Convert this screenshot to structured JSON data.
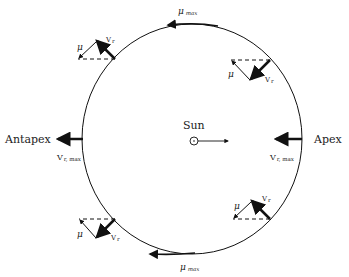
{
  "diagram": {
    "center_label": "Sun",
    "left_label": "Antapex",
    "right_label": "Apex",
    "top_label": {
      "symbol": "μ",
      "subscript": "max"
    },
    "bottom_label": {
      "symbol": "μ",
      "subscript": "max"
    },
    "left_vr_label": {
      "symbol": "V",
      "subscript": "r, max"
    },
    "right_vr_label": {
      "symbol": "V",
      "subscript": "r, max"
    },
    "quadrants": {
      "top_left": {
        "mu": "μ",
        "v": "V",
        "v_sub": "r"
      },
      "top_right": {
        "mu": "μ",
        "v": "V",
        "v_sub": "r"
      },
      "bottom_right": {
        "mu": "μ",
        "v": "V",
        "v_sub": "r"
      },
      "bottom_left": {
        "mu": "μ",
        "v": "V",
        "v_sub": "r"
      }
    },
    "colors": {
      "stroke": "#111111",
      "background": "#ffffff"
    }
  }
}
